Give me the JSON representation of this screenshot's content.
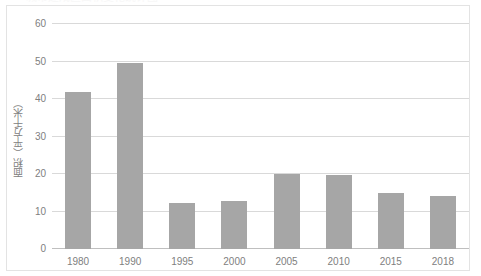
{
  "title_sliver": "城市建成区面积变化统计图",
  "chart_data": {
    "type": "bar",
    "title": "",
    "xlabel": "",
    "ylabel": "面积（平方千米）",
    "categories": [
      "1980",
      "1990",
      "1995",
      "2000",
      "2005",
      "2010",
      "2015",
      "2018"
    ],
    "values": [
      41.8,
      49.7,
      12.2,
      12.7,
      20.0,
      19.8,
      14.9,
      14.2
    ],
    "ylim": [
      0,
      60
    ],
    "yticks": [
      "0",
      "10",
      "20",
      "30",
      "40",
      "50",
      "60"
    ],
    "ytick_values": [
      0,
      10,
      20,
      30,
      40,
      50,
      60
    ],
    "grid": true,
    "legend": "none",
    "bar_color": "#a6a6a6",
    "gridline_color": "#d9d9d9",
    "text_color": "#808080"
  }
}
